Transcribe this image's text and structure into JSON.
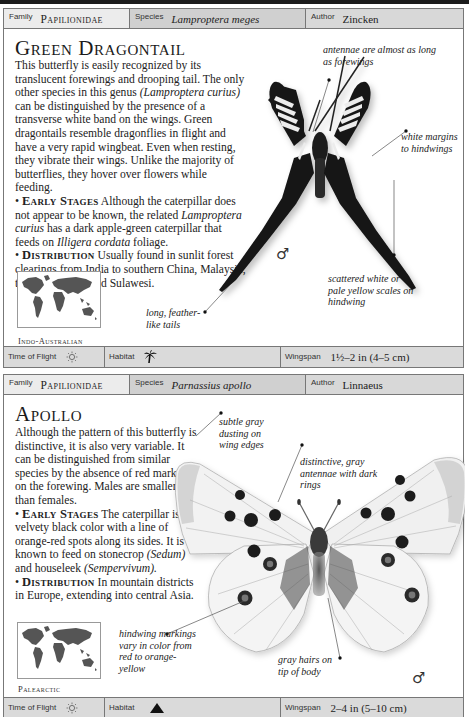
{
  "page": {
    "entries": [
      {
        "header": {
          "family_label": "Family",
          "family": "Papilionidae",
          "species_label": "Species",
          "species": "Lamproptera meges",
          "author_label": "Author",
          "author": "Zincken"
        },
        "title": "Green Dragontail",
        "intro": "This butterfly is easily recognized by its translucent forewings and drooping tail. The only other species in this genus",
        "intro_italic": "(Lamproptera curius)",
        "intro_2": "can be distinguished by the presence of a transverse white band on the wings. Green dragontails resemble dragonflies in flight and have a very rapid wingbeat. Even when resting, they vibrate their wings. Unlike the majority of butterflies, they hover over flowers while feeding.",
        "early_stages_heading": "Early Stages",
        "early_stages_1": "Although the caterpillar does not appear to be known, the related",
        "early_stages_italic_1": "Lamproptera curius",
        "early_stages_2": "has a dark apple-green caterpillar that feeds on",
        "early_stages_italic_2": "Illigera cordata",
        "early_stages_3": "foliage.",
        "distribution_heading": "Distribution",
        "distribution": "Usually found in sunlit forest clearings from India to southern China, Malaysia, the Philippines, and Sulawesi.",
        "map_label": "Indo-Australian",
        "annotations": {
          "antennae": "antennae are almost as long as forewings",
          "margins": "white margins to hindwings",
          "scales": "scattered white or pale yellow scales on hindwing",
          "tails": "long, feather-like tails"
        },
        "sex_symbol": "♂",
        "footer": {
          "time_of_flight_label": "Time of Flight",
          "time_of_flight_icon": "sun-icon",
          "habitat_label": "Habitat",
          "habitat_icon": "palm-tree-icon",
          "wingspan_label": "Wingspan",
          "wingspan": "1½–2 in (4–5 cm)"
        }
      },
      {
        "header": {
          "family_label": "Family",
          "family": "Papilionidae",
          "species_label": "Species",
          "species": "Parnassius apollo",
          "author_label": "Author",
          "author": "Linnaeus"
        },
        "title": "Apollo",
        "intro": "Although the pattern of this butterfly is distinctive, it is also very variable. It can be distinguished from similar species by the absence of red markings on the forewing. Males are smaller than females.",
        "early_stages_heading": "Early Stages",
        "early_stages_1": "The caterpillar is a velvety black color with a line of orange-red spots along its sides. It is known to feed on stonecrop",
        "early_stages_italic_1": "(Sedum)",
        "early_stages_2": "and houseleek",
        "early_stages_italic_2": "(Sempervivum).",
        "distribution_heading": "Distribution",
        "distribution": "In mountain districts in Europe, extending into central Asia.",
        "map_label": "Palearctic",
        "annotations": {
          "dusting": "subtle gray dusting on wing edges",
          "antennae": "distinctive, gray antennae with dark rings",
          "hindwing": "hindwing markings vary in color from red to orange-yellow",
          "hairs": "gray hairs on tip of body"
        },
        "sex_symbol": "♂",
        "footer": {
          "time_of_flight_label": "Time of Flight",
          "time_of_flight_icon": "sun-icon",
          "habitat_label": "Habitat",
          "habitat_icon": "mountain-icon",
          "wingspan_label": "Wingspan",
          "wingspan": "2–4 in (5–10 cm)"
        }
      }
    ]
  }
}
